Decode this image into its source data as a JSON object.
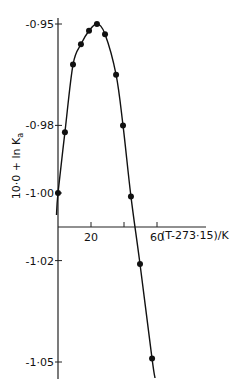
{
  "chart_data": {
    "type": "line",
    "title": "",
    "xlabel": "(T-273·15)/K",
    "ylabel": "10·0 + ln K",
    "ylabel_subscript": "a",
    "xlim": [
      0,
      90
    ],
    "ylim": [
      -1.055,
      -0.943
    ],
    "x_ticks": [
      20,
      40,
      60
    ],
    "x_tick_labels": [
      "20",
      "",
      "60"
    ],
    "y_ticks": [
      -0.95,
      -0.98,
      -1.0,
      -1.02,
      -1.05
    ],
    "y_tick_labels": [
      "-0·95",
      "-0·98",
      "-1·00",
      "-1·02",
      "-1·05"
    ],
    "grid": false,
    "legend": null,
    "series": [
      {
        "name": "measured",
        "marker": "filled-circle",
        "line": "smooth-curve",
        "x": [
          0.0,
          4.2,
          9.1,
          13.9,
          18.8,
          23.6,
          28.5,
          35.2,
          39.4,
          44.2,
          49.7,
          57.0
        ],
        "y": [
          -1.0,
          -0.982,
          -0.962,
          -0.956,
          -0.952,
          -0.95,
          -0.953,
          -0.965,
          -0.98,
          -1.001,
          -1.021,
          -1.049
        ]
      }
    ]
  }
}
